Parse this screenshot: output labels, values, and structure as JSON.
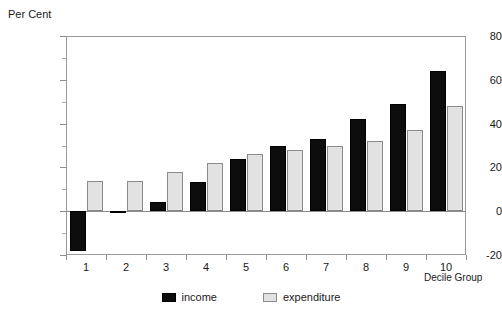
{
  "chart_data": {
    "type": "bar",
    "title": "",
    "xlabel": "Decile Group",
    "ylabel": "Per Cent",
    "categories": [
      "1",
      "2",
      "3",
      "4",
      "5",
      "6",
      "7",
      "8",
      "9",
      "10"
    ],
    "series": [
      {
        "name": "income",
        "color": "#0d0d0d",
        "values": [
          -18,
          -1,
          4,
          13.5,
          24,
          30,
          33,
          42,
          49,
          64
        ]
      },
      {
        "name": "expenditure",
        "color": "#e2e2e2",
        "values": [
          14,
          14,
          18,
          22,
          26,
          28,
          30,
          32,
          37,
          48
        ]
      }
    ],
    "ylim": [
      -20,
      80
    ],
    "ytick_major": [
      -20,
      0,
      20,
      40,
      60,
      80
    ],
    "ytick_minor": [
      -10,
      10,
      30,
      50,
      70
    ],
    "ytick_labels": [
      "-20",
      "0",
      "20",
      "40",
      "60",
      "80"
    ],
    "grid": false,
    "legend_position": "bottom",
    "zero_line": 0
  },
  "legend": {
    "entries": [
      {
        "label": "income"
      },
      {
        "label": "expenditure"
      }
    ]
  },
  "axes": {
    "y_title": "Per Cent",
    "x_title": "Decile Group"
  }
}
